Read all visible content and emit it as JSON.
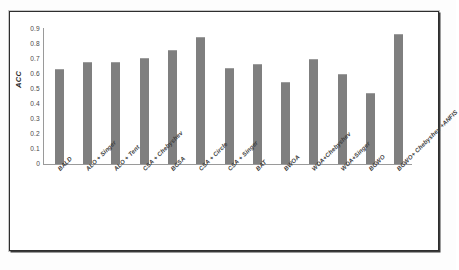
{
  "chart_data": {
    "type": "bar",
    "title": "",
    "xlabel": "",
    "ylabel": "ACC",
    "ylim": [
      0,
      0.9
    ],
    "yticks": [
      "0.9",
      "0.8",
      "0.7",
      "0.6",
      "0.5",
      "0.4",
      "0.3",
      "0.2",
      "0.1",
      "0"
    ],
    "ytick_values": [
      0.9,
      0.8,
      0.7,
      0.6,
      0.5,
      0.4,
      0.3,
      0.2,
      0.1,
      0
    ],
    "grid": false,
    "legend": null,
    "bar_color": "#7f7f7f",
    "categories": [
      "BALD",
      "ALO + Singer",
      "ALO + Tent",
      "CSA + Chebyshev",
      "BCSA",
      "CSA + Circle",
      "CSA + Singer",
      "BAT",
      "BWOA",
      "WOA+Chebyshev",
      "WOA+Singer",
      "BGWO",
      "BGWO+ Chebyshev +ANFIS"
    ],
    "values": [
      0.635,
      0.68,
      0.68,
      0.705,
      0.76,
      0.845,
      0.64,
      0.665,
      0.55,
      0.7,
      0.6,
      0.475,
      0.865
    ]
  }
}
